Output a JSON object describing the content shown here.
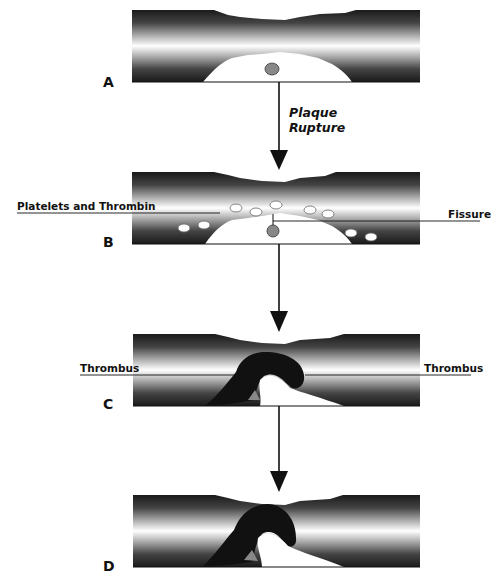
{
  "diagram": {
    "stages": [
      {
        "id": "A",
        "label": "A"
      },
      {
        "id": "B",
        "label": "B"
      },
      {
        "id": "C",
        "label": "C"
      },
      {
        "id": "D",
        "label": "D"
      }
    ],
    "arrows": [
      {
        "from": "A",
        "to": "B",
        "label_line1": "Plaque",
        "label_line2": "Rupture"
      },
      {
        "from": "B",
        "to": "C"
      },
      {
        "from": "C",
        "to": "D"
      }
    ],
    "callouts": {
      "platelets": "Platelets and Thrombin",
      "fissure": "Fissure",
      "thrombus_left": "Thrombus",
      "thrombus_right": "Thrombus"
    },
    "colors": {
      "vessel_dark": "#1a1a1a",
      "vessel_light": "#ffffff",
      "plaque": "#ffffff",
      "thrombus": "#111111",
      "lipid_core": "#888888",
      "line": "#111111"
    }
  }
}
